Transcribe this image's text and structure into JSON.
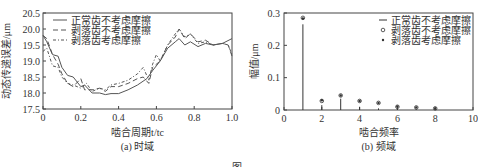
{
  "chart_data": [
    {
      "type": "line",
      "panel": "(a) 时域",
      "xlabel": "啮合周期t/t_c",
      "ylabel": "动态传递误差/μm",
      "xlim": [
        0,
        1.0
      ],
      "ylim": [
        17.5,
        20.5
      ],
      "xticks": [
        "0",
        "0.2",
        "0.4",
        "0.6",
        "0.8",
        "1.0"
      ],
      "yticks": [
        "17.5",
        "18.0",
        "18.5",
        "19.0",
        "19.5",
        "20.0",
        "20.5"
      ],
      "legend": [
        "正常齿不考虑摩擦",
        "剥落齿不考虑摩擦",
        "剥落齿考虑摩擦"
      ],
      "series": [
        {
          "name": "正常齿不考虑摩擦",
          "style": "solid",
          "x": [
            0,
            0.02,
            0.05,
            0.08,
            0.1,
            0.13,
            0.16,
            0.2,
            0.22,
            0.26,
            0.3,
            0.33,
            0.36,
            0.4,
            0.45,
            0.5,
            0.55,
            0.58,
            0.62,
            0.66,
            0.7,
            0.72,
            0.75,
            0.78,
            0.82,
            0.86,
            0.9,
            0.95,
            1.0
          ],
          "y": [
            19.8,
            19.6,
            19.2,
            19.15,
            18.8,
            18.55,
            18.5,
            18.2,
            18.25,
            18.0,
            18.0,
            17.95,
            17.98,
            17.98,
            18.1,
            18.25,
            18.45,
            18.7,
            19.0,
            19.4,
            19.6,
            19.7,
            19.5,
            19.6,
            19.45,
            19.55,
            19.5,
            19.55,
            19.7
          ]
        },
        {
          "name": "剥落齿不考虑摩擦",
          "style": "dashed",
          "x": [
            0,
            0.02,
            0.05,
            0.08,
            0.1,
            0.13,
            0.16,
            0.2,
            0.22,
            0.26,
            0.3,
            0.33,
            0.36,
            0.4,
            0.45,
            0.5,
            0.53,
            0.56,
            0.58,
            0.62,
            0.66,
            0.7,
            0.72,
            0.75,
            0.78,
            0.82,
            0.86,
            0.9,
            0.95,
            0.98,
            1.0
          ],
          "y": [
            19.8,
            19.7,
            19.2,
            18.9,
            18.6,
            18.3,
            18.2,
            18.45,
            18.1,
            18.1,
            18.15,
            18.05,
            18.2,
            18.2,
            18.3,
            18.45,
            18.5,
            18.3,
            18.8,
            19.0,
            19.5,
            19.75,
            20.0,
            19.7,
            19.85,
            19.6,
            19.65,
            19.5,
            19.55,
            19.5,
            19.15
          ]
        },
        {
          "name": "剥落齿考虑摩擦",
          "style": "dashdot",
          "x": [
            0,
            0.02,
            0.05,
            0.08,
            0.1,
            0.13,
            0.16,
            0.2,
            0.23,
            0.26,
            0.3,
            0.33,
            0.36,
            0.4,
            0.45,
            0.5,
            0.53,
            0.56,
            0.58,
            0.6,
            0.62,
            0.66,
            0.7,
            0.72,
            0.75,
            0.78,
            0.82,
            0.86,
            0.9,
            0.95,
            0.98,
            1.0
          ],
          "y": [
            19.3,
            19.4,
            18.85,
            18.8,
            18.5,
            18.3,
            18.25,
            18.15,
            18.3,
            18.05,
            18.15,
            18.1,
            18.25,
            18.3,
            18.4,
            18.6,
            18.8,
            18.4,
            18.9,
            19.2,
            19.0,
            19.5,
            19.85,
            20.0,
            19.75,
            19.85,
            19.55,
            19.6,
            19.5,
            19.55,
            19.5,
            19.2
          ]
        }
      ]
    },
    {
      "type": "stem",
      "panel": "(b) 频域",
      "xlabel": "啮合频率",
      "ylabel": "幅值/μm",
      "xlim": [
        0,
        10
      ],
      "ylim": [
        0,
        0.3
      ],
      "xticks": [
        "0",
        "2",
        "4",
        "6",
        "8",
        "10"
      ],
      "yticks": [
        "0",
        "0.1",
        "0.2",
        "0.3"
      ],
      "legend": [
        "正常齿不考虑摩擦",
        "剥落齿不考虑摩擦",
        "剥落齿考虑摩擦"
      ],
      "categories": [
        1,
        2,
        3,
        4,
        5,
        6,
        7,
        8
      ],
      "series": [
        {
          "name": "正常齿不考虑摩擦",
          "marker": "stem-line",
          "values": [
            0.265,
            0.015,
            0.035,
            0.01,
            0.005,
            0.003,
            0.002,
            0.001
          ]
        },
        {
          "name": "剥落齿不考虑摩擦",
          "marker": "open-circle",
          "values": [
            0.285,
            0.028,
            0.045,
            0.028,
            0.022,
            0.01,
            0.008,
            0.005
          ]
        },
        {
          "name": "剥落齿考虑摩擦",
          "marker": "dot",
          "values": [
            0.283,
            0.03,
            0.045,
            0.028,
            0.022,
            0.011,
            0.008,
            0.005
          ]
        }
      ]
    }
  ],
  "captions": {
    "a": "(a) 时域",
    "b": "(b) 频域",
    "figure": "图"
  }
}
